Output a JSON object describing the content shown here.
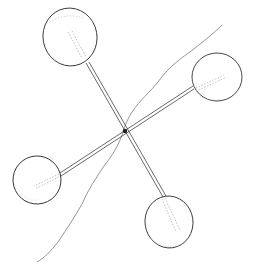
{
  "figure": {
    "width": 256,
    "height": 271,
    "background": "#ffffff",
    "stroke_color": "#333333",
    "light_stroke_color": "#9a9a9a",
    "center": {
      "x": 124,
      "y": 131
    },
    "spheres": [
      {
        "name": "top-left",
        "cx": 70,
        "cy": 37,
        "rx": 27,
        "ry": 29
      },
      {
        "name": "right",
        "cx": 217,
        "cy": 77,
        "rx": 25,
        "ry": 24
      },
      {
        "name": "bottom-left",
        "cx": 37,
        "cy": 180,
        "rx": 24,
        "ry": 24
      },
      {
        "name": "bottom",
        "cx": 169,
        "cy": 222,
        "rx": 24,
        "ry": 26
      }
    ],
    "contour_line": "wavy boundary line running from upper right to lower left through the junction"
  }
}
